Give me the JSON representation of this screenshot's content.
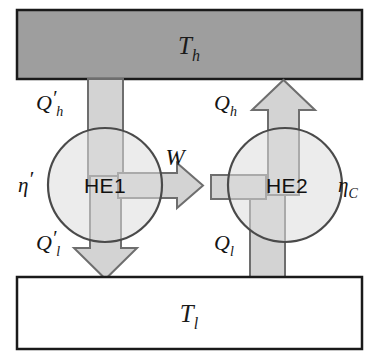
{
  "figure": {
    "kind": "thermodynamics-heat-engine-diagram",
    "width": 379,
    "height": 359,
    "background": "#ffffff"
  },
  "colors": {
    "hot_reservoir_fill": "#9e9e9e",
    "cold_reservoir_fill": "#ffffff",
    "reservoir_stroke": "#1a1a1a",
    "flow_fill": "#d3d3d3",
    "flow_stroke": "#6e6e6e",
    "engine_fill": "#dcdcdc",
    "engine_stroke": "#4a4a4a",
    "text": "#141414"
  },
  "reservoirs": {
    "hot": {
      "label": "T",
      "subscript": "h",
      "name": "hot-reservoir"
    },
    "cold": {
      "label": "T",
      "subscript": "l",
      "name": "cold-reservoir"
    }
  },
  "engines": [
    {
      "id": "he1",
      "label": "HE1",
      "efficiency": {
        "symbol": "η",
        "prime": "′",
        "subscript": ""
      },
      "heat_in": {
        "symbol": "Q",
        "prime": "′",
        "subscript": "h"
      },
      "heat_out": {
        "symbol": "Q",
        "prime": "′",
        "subscript": "l"
      }
    },
    {
      "id": "he2",
      "label": "HE2",
      "efficiency": {
        "symbol": "η",
        "prime": "",
        "subscript": "C"
      },
      "heat_out_up": {
        "symbol": "Q",
        "prime": "",
        "subscript": "h"
      },
      "heat_in_up": {
        "symbol": "Q",
        "prime": "",
        "subscript": "l"
      }
    }
  ],
  "work": {
    "label": "W",
    "direction": "right"
  }
}
